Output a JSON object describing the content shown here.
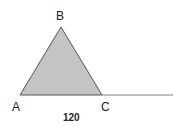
{
  "diagram": {
    "type": "geometry-triangle",
    "vertices": {
      "A": {
        "label": "A",
        "x": 20,
        "y": 95
      },
      "B": {
        "label": "B",
        "x": 61,
        "y": 27
      },
      "C": {
        "label": "C",
        "x": 102,
        "y": 95
      }
    },
    "extension": {
      "from": "C",
      "to_x": 173,
      "y": 95
    },
    "base_value": "120",
    "colors": {
      "fill": "#c4c4c4",
      "stroke": "#555555",
      "extension_line": "#aaaaaa",
      "text": "#222222"
    }
  }
}
